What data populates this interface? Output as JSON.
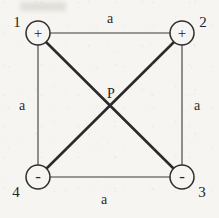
{
  "figure": {
    "background_color": "#f7f5f2",
    "line_color": "#2e2e2e",
    "diagonal_color": "#2b2b2b",
    "text_color": "#262626"
  },
  "nodes": [
    {
      "id": "node-1",
      "corner_label": "1",
      "sign": "+",
      "position": "top-left",
      "cx": 38,
      "cy": 33,
      "r": 12,
      "label_x": 17,
      "label_y": 22
    },
    {
      "id": "node-2",
      "corner_label": "2",
      "sign": "+",
      "position": "top-right",
      "cx": 182,
      "cy": 33,
      "r": 12,
      "label_x": 203,
      "label_y": 22
    },
    {
      "id": "node-3",
      "corner_label": "3",
      "sign": "-",
      "position": "bottom-right",
      "cx": 182,
      "cy": 177,
      "r": 12,
      "label_x": 202,
      "label_y": 192
    },
    {
      "id": "node-4",
      "corner_label": "4",
      "sign": "-",
      "position": "bottom-left",
      "cx": 38,
      "cy": 177,
      "r": 12,
      "label_x": 16,
      "label_y": 192
    }
  ],
  "edges": [
    {
      "id": "edge-top",
      "label": "a",
      "label_x": 110,
      "label_y": 18,
      "from": "node-1",
      "to": "node-2"
    },
    {
      "id": "edge-right",
      "label": "a",
      "label_x": 197,
      "label_y": 105,
      "from": "node-2",
      "to": "node-3"
    },
    {
      "id": "edge-bottom",
      "label": "a",
      "label_x": 104,
      "label_y": 199,
      "from": "node-4",
      "to": "node-3"
    },
    {
      "id": "edge-left",
      "label": "a",
      "label_x": 22,
      "label_y": 105,
      "from": "node-1",
      "to": "node-4"
    }
  ],
  "diagonals": [
    {
      "id": "diagonal-1-3",
      "from": "node-1",
      "to": "node-3"
    },
    {
      "id": "diagonal-2-4",
      "from": "node-2",
      "to": "node-4"
    }
  ],
  "center_point": {
    "id": "point-p",
    "label": "P",
    "x": 110,
    "y": 105,
    "label_x": 111,
    "label_y": 93
  }
}
